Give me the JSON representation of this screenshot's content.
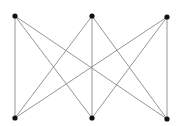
{
  "diagram": {
    "type": "bipartite-graph",
    "edge_color": "#8a8a8a",
    "node_color": "#111111",
    "node_radius": 2.6,
    "nodes": [
      {
        "id": "t1",
        "x": 15,
        "y": 16
      },
      {
        "id": "t2",
        "x": 92,
        "y": 16
      },
      {
        "id": "t3",
        "x": 167,
        "y": 17
      },
      {
        "id": "b1",
        "x": 15,
        "y": 118
      },
      {
        "id": "b2",
        "x": 92,
        "y": 118
      },
      {
        "id": "b3",
        "x": 167,
        "y": 119
      }
    ],
    "edges": [
      [
        "t1",
        "b1"
      ],
      [
        "t1",
        "b2"
      ],
      [
        "t1",
        "b3"
      ],
      [
        "t2",
        "b1"
      ],
      [
        "t2",
        "b2"
      ],
      [
        "t2",
        "b3"
      ],
      [
        "t3",
        "b1"
      ],
      [
        "t3",
        "b2"
      ],
      [
        "t3",
        "b3"
      ]
    ]
  }
}
